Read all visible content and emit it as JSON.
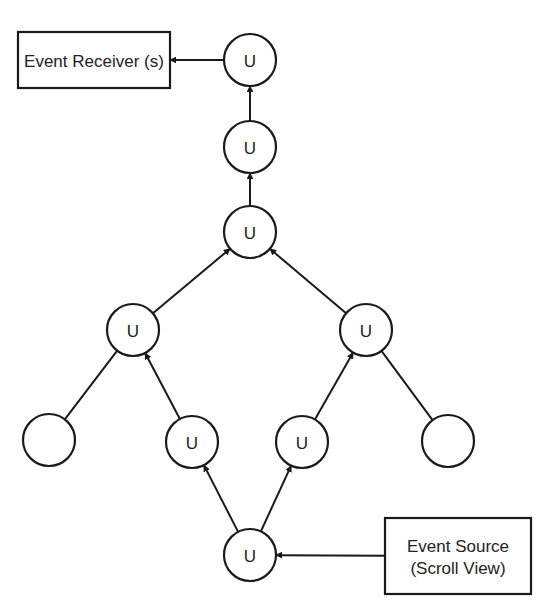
{
  "diagram": {
    "type": "event-propagation-tree",
    "colors": {
      "stroke": "#1a1a1a",
      "text": "#222222",
      "background": "#ffffff"
    },
    "boxes": [
      {
        "id": "receiver",
        "lines": [
          "Event Receiver (s)"
        ],
        "x": 18,
        "y": 32,
        "w": 152,
        "h": 56
      },
      {
        "id": "source",
        "lines": [
          "Event Source",
          "(Scroll View)"
        ],
        "x": 385,
        "y": 518,
        "w": 146,
        "h": 76
      }
    ],
    "nodes": [
      {
        "id": "u_top",
        "label": "U",
        "cx": 250,
        "cy": 60
      },
      {
        "id": "u_mid1",
        "label": "U",
        "cx": 250,
        "cy": 147
      },
      {
        "id": "u_mid2",
        "label": "U",
        "cx": 250,
        "cy": 232
      },
      {
        "id": "u_left",
        "label": "U",
        "cx": 133,
        "cy": 330
      },
      {
        "id": "u_right",
        "label": "U",
        "cx": 366,
        "cy": 330
      },
      {
        "id": "leaf_left",
        "label": "",
        "cx": 49,
        "cy": 440
      },
      {
        "id": "u_left_low",
        "label": "U",
        "cx": 192,
        "cy": 442
      },
      {
        "id": "u_right_low",
        "label": "U",
        "cx": 302,
        "cy": 442
      },
      {
        "id": "leaf_right",
        "label": "",
        "cx": 448,
        "cy": 441
      },
      {
        "id": "u_bottom",
        "label": "U",
        "cx": 250,
        "cy": 555
      }
    ],
    "node_radius": 26,
    "edges": [
      {
        "from": "source",
        "to": "u_bottom",
        "arrow": true
      },
      {
        "from": "u_bottom",
        "to": "u_left_low",
        "arrow": true
      },
      {
        "from": "u_bottom",
        "to": "u_right_low",
        "arrow": true
      },
      {
        "from": "u_left_low",
        "to": "u_left",
        "arrow": true
      },
      {
        "from": "u_right_low",
        "to": "u_right",
        "arrow": true
      },
      {
        "from": "leaf_left",
        "to": "u_left",
        "arrow": false
      },
      {
        "from": "leaf_right",
        "to": "u_right",
        "arrow": false
      },
      {
        "from": "u_left",
        "to": "u_mid2",
        "arrow": true
      },
      {
        "from": "u_right",
        "to": "u_mid2",
        "arrow": true
      },
      {
        "from": "u_mid2",
        "to": "u_mid1",
        "arrow": true
      },
      {
        "from": "u_mid1",
        "to": "u_top",
        "arrow": true
      },
      {
        "from": "u_top",
        "to": "receiver",
        "arrow": true
      }
    ]
  }
}
